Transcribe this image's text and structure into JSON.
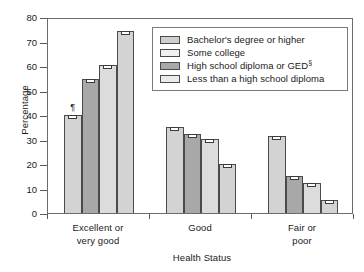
{
  "chart_data": {
    "type": "bar",
    "title": "",
    "xlabel": "Health Status",
    "ylabel": "Percentage",
    "ylim": [
      0,
      80
    ],
    "ytick_step": 10,
    "yticks": [
      0,
      10,
      20,
      30,
      40,
      50,
      60,
      70,
      80
    ],
    "ytick_labels": [
      "0",
      "10",
      "20",
      "30",
      "40",
      "50",
      "60",
      "70",
      "80"
    ],
    "grid": false,
    "legend_position": "upper right inside plot",
    "error_bars": true,
    "categories": [
      "Excellent or very good",
      "Good",
      "Fair or poor"
    ],
    "category_lines": [
      [
        "Excellent or",
        "very good"
      ],
      [
        "Good",
        ""
      ],
      [
        "Fair or",
        "poor"
      ]
    ],
    "series": [
      {
        "name": "Bachelor's degree or higher",
        "values": [
          40.1,
          35.1,
          31.5
        ],
        "errors": [
          0.6,
          0.4,
          0.5
        ]
      },
      {
        "name": "Some college",
        "values": [
          54.5,
          32.1,
          15.3
        ],
        "errors": [
          0.5,
          0.4,
          0.4
        ]
      },
      {
        "name": "High school diploma or GED",
        "values": [
          60.3,
          30.4,
          12.2
        ],
        "errors": [
          0.5,
          0.4,
          0.4
        ],
        "footnote_symbol": "§"
      },
      {
        "name": "Less than a high school diploma",
        "values": [
          74.3,
          20.2,
          5.3
        ],
        "errors": [
          0.5,
          0.4,
          0.3
        ]
      }
    ],
    "annotations": [
      {
        "text": "¶",
        "category": "Excellent or very good",
        "series": "Bachelor's degree or higher",
        "note": "footnote marker above first bar"
      }
    ]
  },
  "legend": {
    "entries": [
      {
        "label": "Bachelor's degree or higher",
        "sup": ""
      },
      {
        "label": "Some college",
        "sup": ""
      },
      {
        "label": "High school diploma or GED",
        "sup": "§"
      },
      {
        "label": "Less than a high school diploma",
        "sup": ""
      }
    ]
  },
  "colors": {
    "bar_light": "#d3d3d3",
    "bar_medium": "#a8a8a8",
    "bar_lighter": "#dcdcdc",
    "bar_outline": "#4a4a4a",
    "frame": "#6b6b6b",
    "text": "#1a1a1a",
    "background": "#ffffff"
  }
}
